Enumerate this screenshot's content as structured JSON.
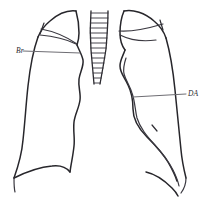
{
  "figure": {
    "canvas": {
      "width": 207,
      "height": 208
    },
    "background_color": "#ffffff",
    "ink_color": "#27262b",
    "leader_color": "#6e6d73"
  },
  "annotations": [
    {
      "id": "br",
      "label": "Br",
      "meaning": "bronchus",
      "side": "left",
      "label_x": 16,
      "label_y": 53,
      "leader_from_x": 23,
      "leader_from_y": 51,
      "leader_to_x": 80,
      "leader_to_y": 53
    },
    {
      "id": "da",
      "label": "DA",
      "meaning": "descending aorta",
      "side": "right",
      "label_x": 188,
      "label_y": 96,
      "leader_from_x": 186,
      "leader_from_y": 94,
      "leader_to_x": 133,
      "leader_to_y": 97
    }
  ],
  "parts": {
    "left_lung_label": "Left lung field outline",
    "right_lung_label": "Right lung field outline",
    "trachea_label": "Trachea with cartilage rings",
    "left_apex_label": "Left apical contour",
    "right_apex_label": "Right apical contour",
    "left_diaphragm_label": "Left hemidiaphragm",
    "right_diaphragm_label": "Right hemidiaphragm",
    "mediastinum_label": "Mediastinal border"
  },
  "trachea": {
    "ring_count": 14,
    "top_y": 11,
    "bottom_y": 84
  }
}
